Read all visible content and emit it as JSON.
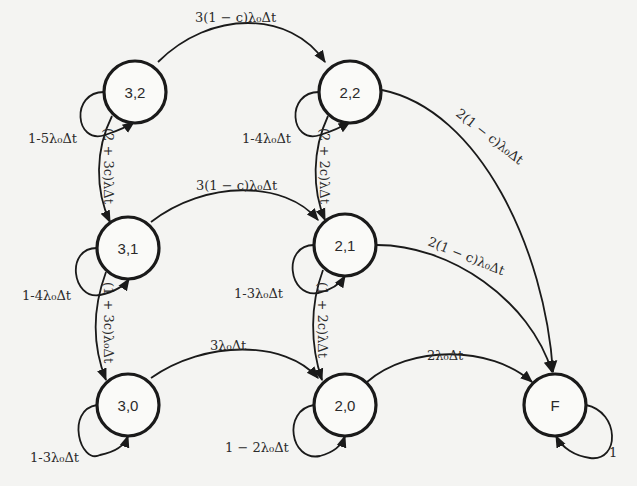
{
  "diagram": {
    "type": "state-transition (Markov chain)",
    "colors": {
      "background": "#f4f4f2",
      "stroke": "#1a1a1a",
      "text": "#2b2b2b"
    },
    "nodes": [
      {
        "id": "n32",
        "label": "3,2"
      },
      {
        "id": "n22",
        "label": "2,2"
      },
      {
        "id": "n31",
        "label": "3,1"
      },
      {
        "id": "n21",
        "label": "2,1"
      },
      {
        "id": "n30",
        "label": "3,0"
      },
      {
        "id": "n20",
        "label": "2,0"
      },
      {
        "id": "nF",
        "label": "F"
      }
    ],
    "edges": {
      "e32_22": "3(1 − c)λ₀Δt",
      "e31_21": "3(1 − c)λ₀Δt",
      "e30_20": "3λ₀Δt",
      "e22_F": "2(1 − c)λ₀Δt",
      "e21_F": "2(1 − c)λ₀Δt",
      "e20_F": "2λ₀Δt",
      "e32_31": "(2 + 3c)λΔt",
      "e31_30": "(1 + 3c)λ₀Δt",
      "e22_21": "(2 + 2c)λΔt",
      "e21_20": "(1 + 2c)λΔt"
    },
    "self_loops": {
      "n32": "1-5λ₀Δt",
      "n22": "1-4λ₀Δt",
      "n31": "1-4λ₀Δt",
      "n21": "1-3λ₀Δt",
      "n30": "1-3λ₀Δt",
      "n20": "1 − 2λ₀Δt",
      "nF": "1"
    }
  }
}
